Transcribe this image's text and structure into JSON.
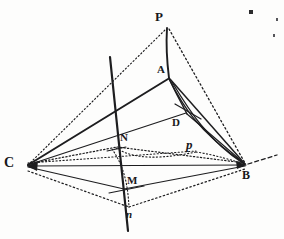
{
  "figure": {
    "ink_color": "#1d1d1f",
    "paper_color": "#fdfdfc",
    "canvas": {
      "width": 284,
      "height": 239
    },
    "labels": [
      {
        "id": "P",
        "text": "P",
        "x": 155,
        "y": 12,
        "size": 12,
        "style": "bold",
        "name": "vertex-label-p"
      },
      {
        "id": "A",
        "text": "A",
        "x": 157,
        "y": 65,
        "size": 11,
        "style": "bold",
        "name": "vertex-label-a"
      },
      {
        "id": "D",
        "text": "D",
        "x": 173,
        "y": 118,
        "size": 11,
        "style": "bold",
        "name": "point-label-d"
      },
      {
        "id": "N",
        "text": "N",
        "x": 120,
        "y": 133,
        "size": 11,
        "style": "bold",
        "name": "point-label-n-upper"
      },
      {
        "id": "p",
        "text": "p",
        "x": 186,
        "y": 139,
        "size": 12,
        "style": "italic",
        "name": "point-label-p-lower"
      },
      {
        "id": "C",
        "text": "C",
        "x": 5,
        "y": 157,
        "size": 13,
        "style": "bold",
        "name": "vertex-label-c"
      },
      {
        "id": "B",
        "text": "B",
        "x": 242,
        "y": 170,
        "size": 12,
        "style": "bold",
        "name": "vertex-label-b"
      },
      {
        "id": "M",
        "text": "M",
        "x": 127,
        "y": 176,
        "size": 11,
        "style": "bold",
        "name": "point-label-m"
      },
      {
        "id": "n",
        "text": "n",
        "x": 126,
        "y": 210,
        "size": 11,
        "style": "italic",
        "name": "point-label-n-lower"
      }
    ],
    "vertices": {
      "P": [
        167,
        27
      ],
      "A": [
        169,
        78
      ],
      "C": [
        27,
        166
      ],
      "B": [
        245,
        165
      ],
      "D": [
        186,
        113
      ],
      "N": [
        117,
        147
      ],
      "M": [
        124,
        189
      ],
      "n_low": [
        129,
        208
      ],
      "p_low": [
        196,
        152
      ]
    },
    "edges": [
      {
        "name": "edge-c-to-p",
        "kind": "dotted",
        "from": "C",
        "to": "P"
      },
      {
        "name": "edge-p-to-b",
        "kind": "dotted",
        "from": "P",
        "to": "B"
      },
      {
        "name": "edge-p-to-a",
        "kind": "solid",
        "from": "P",
        "to": "A"
      },
      {
        "name": "edge-a-to-c",
        "kind": "solid",
        "from": "A",
        "to": "C"
      },
      {
        "name": "edge-a-to-b",
        "kind": "solid",
        "from": "A",
        "to": "B"
      },
      {
        "name": "edge-a-to-d",
        "kind": "solid",
        "from": "A",
        "to": "D"
      },
      {
        "name": "edge-d-to-c",
        "kind": "solid",
        "from": "D",
        "to": "C"
      },
      {
        "name": "edge-d-to-b",
        "kind": "solid",
        "from": "D",
        "to": "B"
      },
      {
        "name": "edge-c-to-b-base",
        "kind": "solid",
        "from": "C",
        "to": "B"
      },
      {
        "name": "edge-c-to-m",
        "kind": "solid",
        "from": "C",
        "to": "M"
      },
      {
        "name": "edge-m-to-b",
        "kind": "solid",
        "from": "M",
        "to": "B"
      },
      {
        "name": "edge-c-to-n-dotted",
        "kind": "dotted",
        "from": "C",
        "to": "N"
      },
      {
        "name": "edge-n-to-b-dotted",
        "kind": "dotted",
        "from": "N",
        "to": "B"
      },
      {
        "name": "edge-c-to-p-low",
        "kind": "dotted",
        "from": "C",
        "to": "p_low"
      },
      {
        "name": "edge-p-low-to-b",
        "kind": "dotted",
        "from": "p_low",
        "to": "B"
      },
      {
        "name": "edge-c-to-n-low",
        "kind": "dotted",
        "from": "C",
        "to": "n_low"
      },
      {
        "name": "edge-n-low-to-b",
        "kind": "dotted",
        "from": "n_low",
        "to": "B"
      }
    ],
    "axis_line": {
      "name": "axis-line-pn",
      "from": [
        110,
        57
      ],
      "to": [
        128,
        231
      ]
    },
    "b_extension": {
      "name": "axis-extension-b",
      "from": [
        248,
        164
      ],
      "to": [
        277,
        155
      ]
    },
    "tick_marks": [
      {
        "name": "tick-mark-d",
        "x1": 175,
        "y1": 104,
        "x2": 200,
        "y2": 118
      },
      {
        "name": "tick-mark-m",
        "x1": 110,
        "y1": 193,
        "x2": 143,
        "y2": 186
      },
      {
        "name": "tick-mark-n",
        "x1": 108,
        "y1": 150,
        "x2": 126,
        "y2": 146
      }
    ],
    "curves": [
      {
        "name": "curve-a-to-b-outer",
        "kind": "solid",
        "d": "M 169 79 C 182 104 196 130 245 164"
      },
      {
        "name": "curve-a-to-b-inner",
        "kind": "solid",
        "d": "M 171 80 C 188 110 206 138 244 164"
      },
      {
        "name": "curve-n-to-p-dotted",
        "kind": "dotted",
        "d": "M 116 148 C 132 160 162 158 196 152"
      },
      {
        "name": "curve-n-arc-dotted",
        "kind": "dotted",
        "d": "M 112 149 C 124 170 128 190 129 207"
      },
      {
        "name": "curve-p-to-b-dotted",
        "kind": "dotted",
        "d": "M 196 152 C 216 155 234 160 244 164"
      }
    ],
    "specks": [
      {
        "name": "ink-speck-1",
        "x": 250,
        "y": 11,
        "size": 3
      },
      {
        "name": "ink-speck-2",
        "x": 276,
        "y": 18,
        "size": 2
      },
      {
        "name": "ink-speck-3",
        "x": 273,
        "y": 34,
        "size": 2
      }
    ]
  }
}
